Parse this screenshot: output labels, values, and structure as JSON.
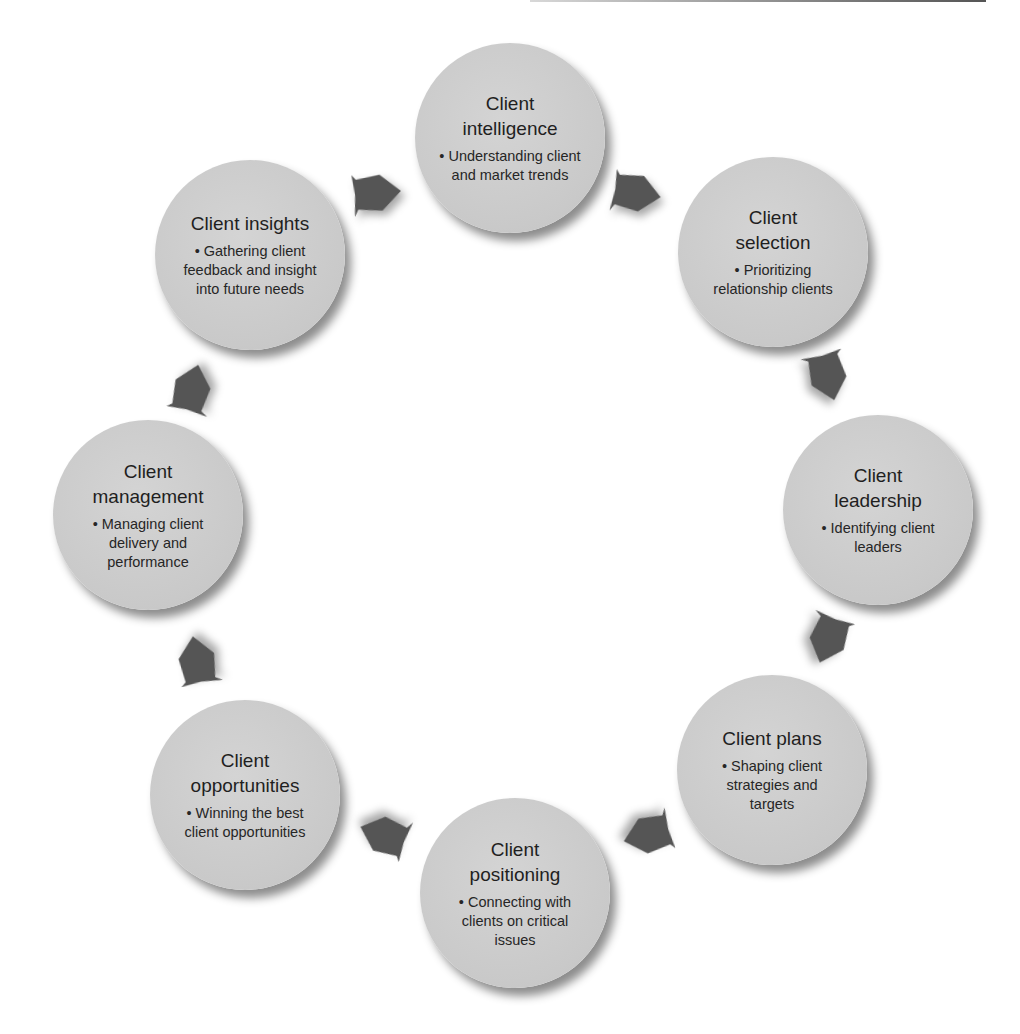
{
  "diagram": {
    "type": "cycle",
    "colors": {
      "node_fill": "#c9c9c9",
      "arrow_fill": "#555555",
      "text": "#1f1f1f",
      "background": "#ffffff"
    },
    "nodes": [
      {
        "id": "intelligence",
        "title": "Client intelligence",
        "title_lines": [
          "Client",
          "intelligence"
        ],
        "bullet": "• Understanding client and market trends"
      },
      {
        "id": "selection",
        "title": "Client selection",
        "title_lines": [
          "Client",
          "selection"
        ],
        "bullet": "• Prioritizing relationship clients"
      },
      {
        "id": "leadership",
        "title": "Client leadership",
        "title_lines": [
          "Client",
          "leadership"
        ],
        "bullet": "• Identifying client leaders"
      },
      {
        "id": "plans",
        "title": "Client plans",
        "title_lines": [
          "Client plans"
        ],
        "bullet": "• Shaping client strategies and targets"
      },
      {
        "id": "positioning",
        "title": "Client positioning",
        "title_lines": [
          "Client",
          "positioning"
        ],
        "bullet": "• Connecting with clients on critical issues"
      },
      {
        "id": "opportunities",
        "title": "Client opportunities",
        "title_lines": [
          "Client",
          "opportunities"
        ],
        "bullet": "• Winning the best client opportunities"
      },
      {
        "id": "management",
        "title": "Client management",
        "title_lines": [
          "Client",
          "management"
        ],
        "bullet": "• Managing client delivery and performance"
      },
      {
        "id": "insights",
        "title": "Client insights",
        "title_lines": [
          "Client insights"
        ],
        "bullet": "• Gathering client feedback and insight into future needs"
      }
    ],
    "edges": [
      {
        "from": "insights",
        "to": "intelligence"
      },
      {
        "from": "intelligence",
        "to": "selection"
      },
      {
        "from": "selection",
        "to": "leadership"
      },
      {
        "from": "leadership",
        "to": "plans"
      },
      {
        "from": "plans",
        "to": "positioning"
      },
      {
        "from": "positioning",
        "to": "opportunities"
      },
      {
        "from": "opportunities",
        "to": "management"
      },
      {
        "from": "management",
        "to": "insights"
      }
    ]
  }
}
